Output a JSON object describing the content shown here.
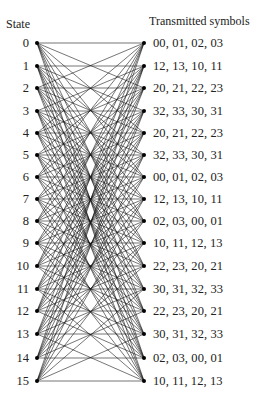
{
  "headers": {
    "left": "State",
    "right": "Transmitted symbols"
  },
  "layout": {
    "left_x": 37,
    "right_x": 144,
    "row_y": [
      43,
      66,
      88,
      111,
      133,
      155,
      177,
      199,
      221,
      243,
      266,
      289,
      311,
      334,
      358,
      381
    ],
    "line_color": "#1a1a1a",
    "node_color": "#000000"
  },
  "states": [
    {
      "id": "0",
      "symbols": "00, 01, 02, 03"
    },
    {
      "id": "1",
      "symbols": "12, 13, 10, 11"
    },
    {
      "id": "2",
      "symbols": "20, 21, 22, 23"
    },
    {
      "id": "3",
      "symbols": "32, 33, 30, 31"
    },
    {
      "id": "4",
      "symbols": "20, 21, 22, 23"
    },
    {
      "id": "5",
      "symbols": "32, 33, 30, 31"
    },
    {
      "id": "6",
      "symbols": "00, 01, 02, 03"
    },
    {
      "id": "7",
      "symbols": "12, 13, 10, 11"
    },
    {
      "id": "8",
      "symbols": "02, 03, 00, 01"
    },
    {
      "id": "9",
      "symbols": "10, 11, 12, 13"
    },
    {
      "id": "10",
      "symbols": "22, 23, 20, 21"
    },
    {
      "id": "11",
      "symbols": "30, 31, 32, 33"
    },
    {
      "id": "12",
      "symbols": "22, 23, 20, 21"
    },
    {
      "id": "13",
      "symbols": "30, 31, 32, 33"
    },
    {
      "id": "14",
      "symbols": "02, 03, 00, 01"
    },
    {
      "id": "15",
      "symbols": "10, 11, 12, 13"
    }
  ]
}
